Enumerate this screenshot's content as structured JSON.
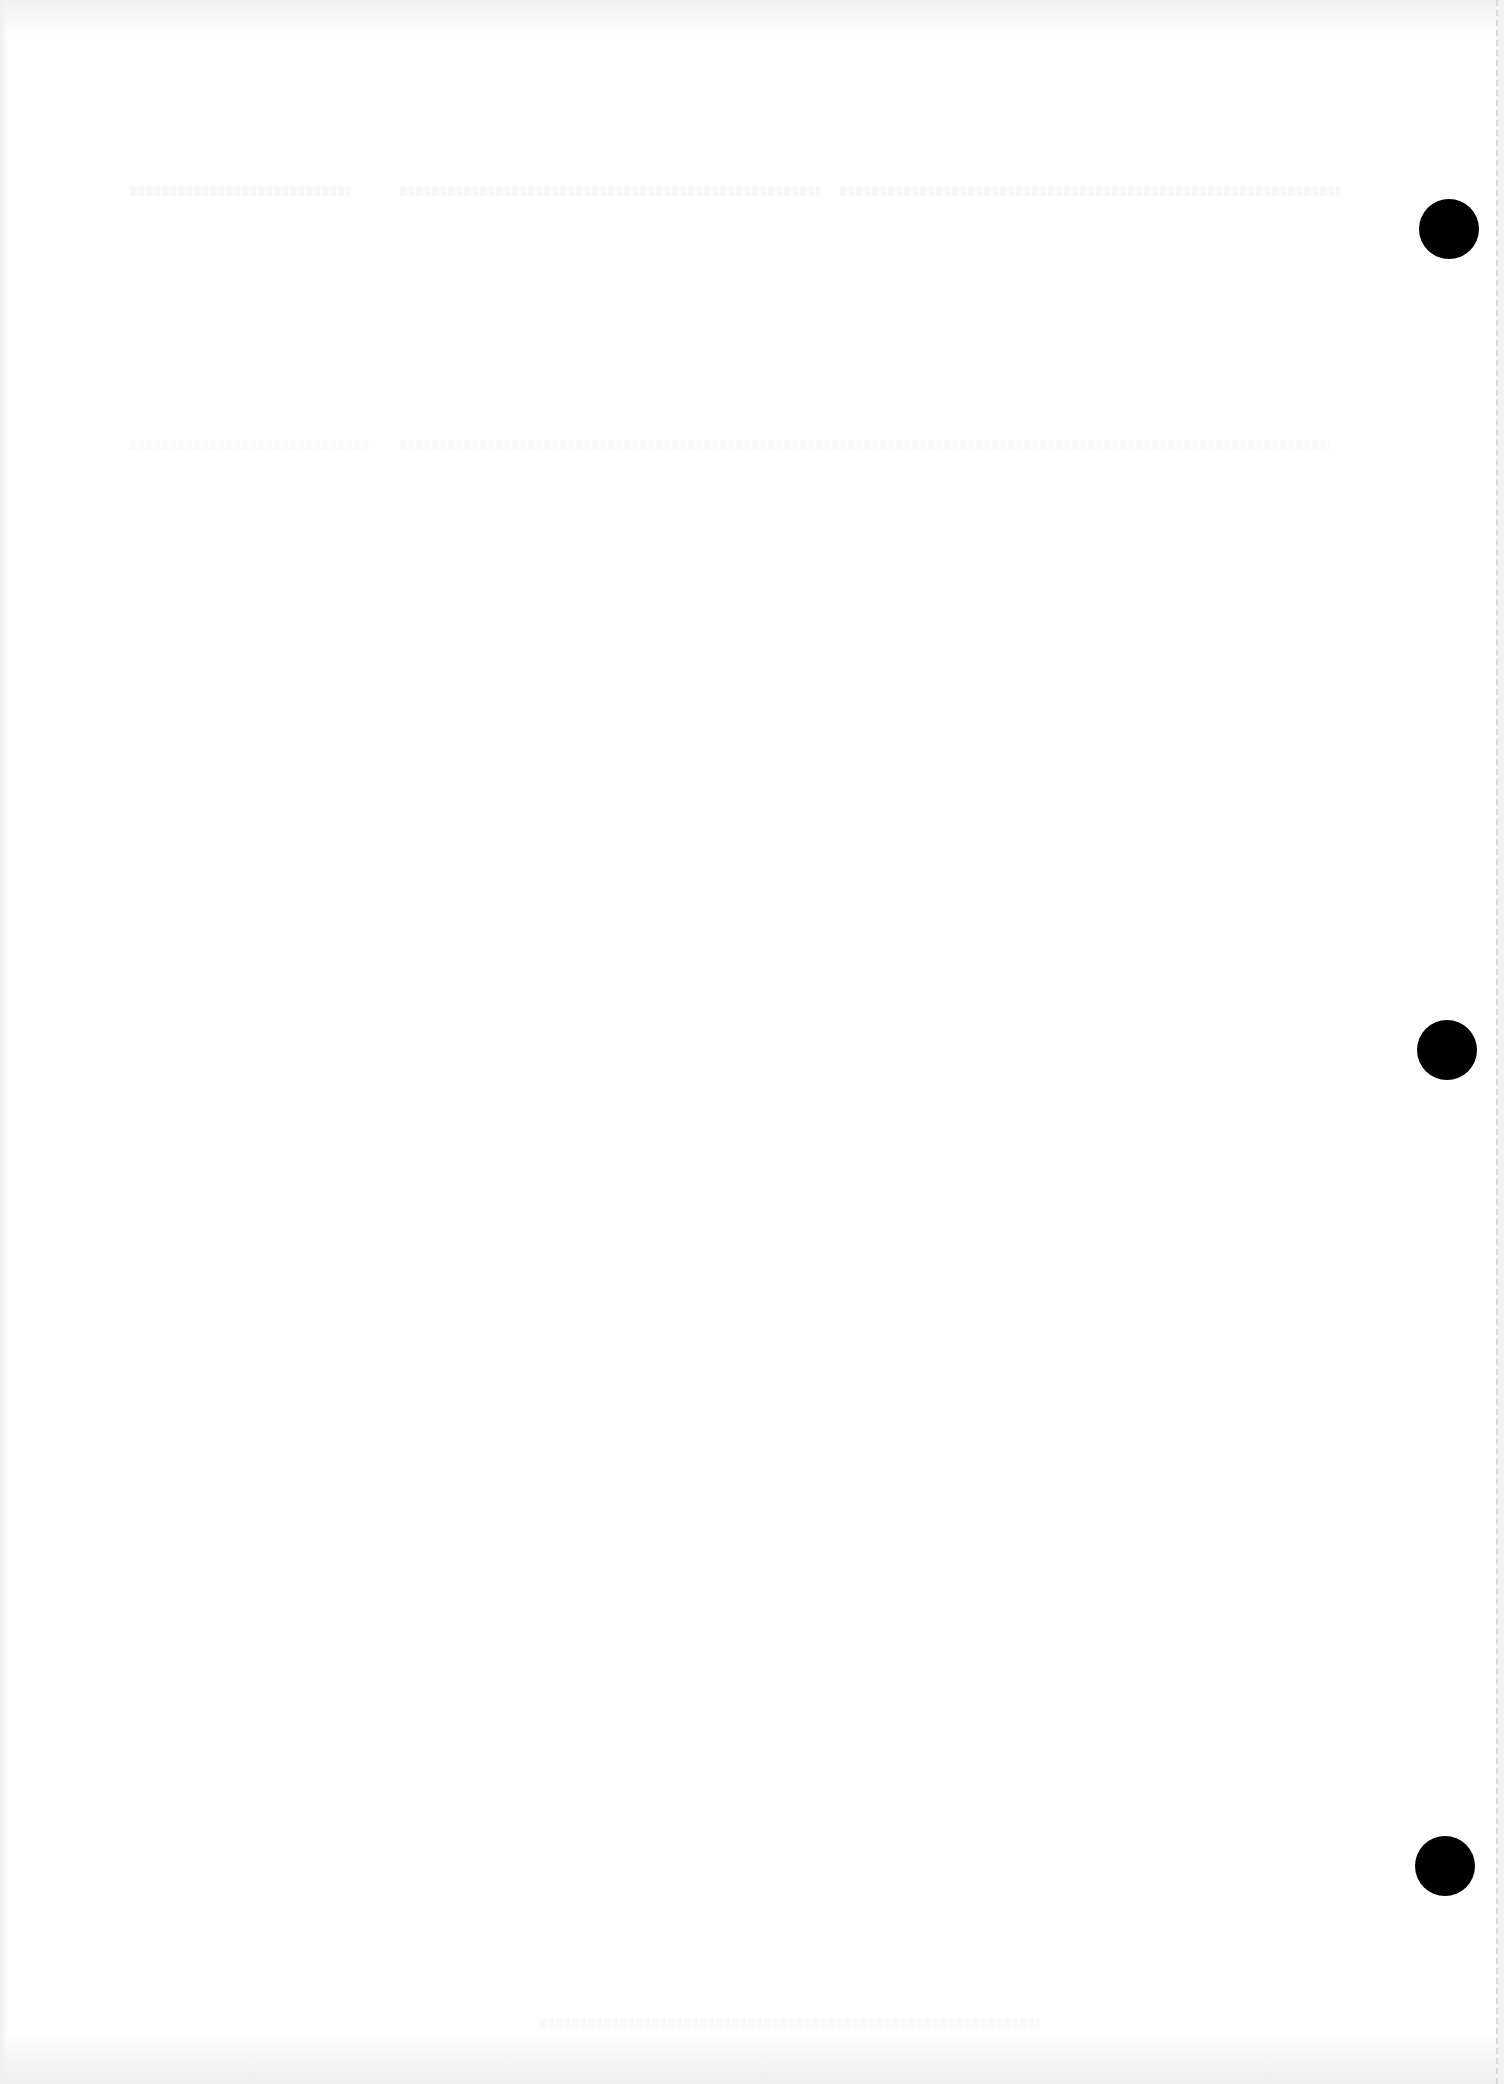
{
  "document": {
    "type": "scanned-page",
    "content_text": "",
    "background_color": "#fefefe",
    "punch_holes": [
      {
        "label": "top",
        "cx": 1449,
        "cy": 229,
        "diameter": 60,
        "color": "#000000"
      },
      {
        "label": "middle",
        "cx": 1447,
        "cy": 1050,
        "diameter": 60,
        "color": "#000000"
      },
      {
        "label": "bottom",
        "cx": 1445,
        "cy": 1866,
        "diameter": 60,
        "color": "#000000"
      }
    ]
  }
}
